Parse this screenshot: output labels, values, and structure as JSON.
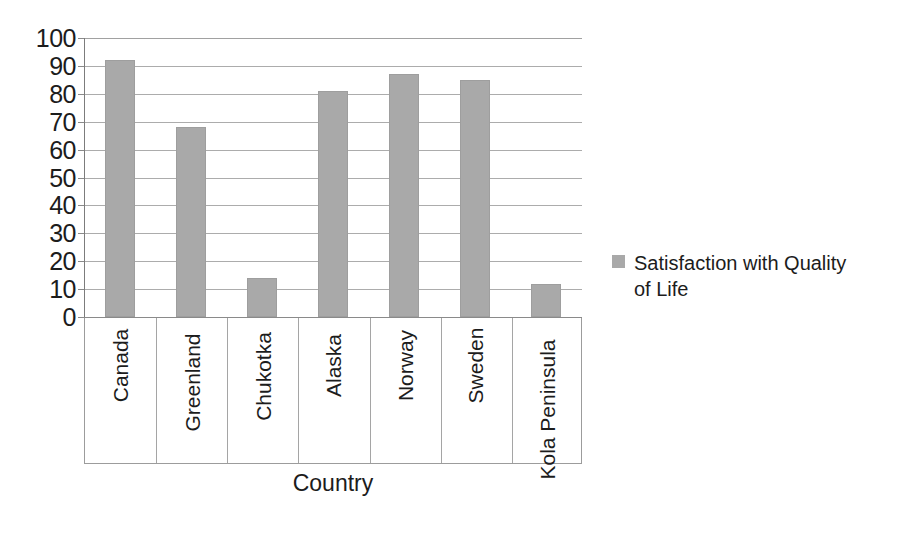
{
  "chart_data": {
    "type": "bar",
    "title": "",
    "subtitle": "",
    "categories": [
      "Canada",
      "Greenland",
      "Chukotka",
      "Alaska",
      "Norway",
      "Sweden",
      "Kola Peninsula"
    ],
    "values": [
      92,
      68,
      14,
      81,
      87,
      85,
      12
    ],
    "series": [
      {
        "name": "Satisfaction with Quality of Life",
        "values": [
          92,
          68,
          14,
          81,
          87,
          85,
          12
        ]
      }
    ],
    "xlabel": "Country",
    "ylabel": "",
    "ylim": [
      0,
      100
    ],
    "ytick_labels": [
      "100",
      "90",
      "80",
      "70",
      "60",
      "50",
      "40",
      "30",
      "20",
      "10",
      "0"
    ],
    "ytick_values": [
      100,
      90,
      80,
      70,
      60,
      50,
      40,
      30,
      20,
      10,
      0
    ],
    "grid": true,
    "grid_axis": "y",
    "legend_position": "right",
    "legend_entries": [
      "Satisfaction with Quality of Life"
    ],
    "bar_color": "#a9a9a9",
    "grid_color": "#9a9a9a",
    "axis_color": "#8a8a8a",
    "text_color": "#1c1c1c",
    "background": "#ffffff",
    "category_label_rotation": -90
  },
  "axes": {
    "x_title": "Country"
  },
  "legend": {
    "items": [
      {
        "label": "Satisfaction with Quality of Life",
        "color": "#a9a9a9"
      }
    ]
  }
}
